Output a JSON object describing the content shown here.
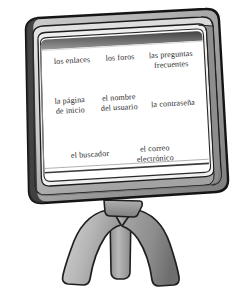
{
  "illustration": {
    "subject": "computer-monitor",
    "description_icons": {
      "monitor": "monitor-icon",
      "stand": "monitor-stand-icon",
      "screen": "screen-surface"
    },
    "colors": {
      "bezel_light": "#b9b9b9",
      "bezel_mid": "#9a9a9a",
      "bezel_dark": "#6f6f6f",
      "outline": "#1c1c1c",
      "screen": "#ffffff",
      "screen_shadow": "#3a3a3a",
      "text": "#2b2b2b",
      "stand_light": "#c3c3c3",
      "stand_dark": "#8a8a8a",
      "background": "#ffffff"
    }
  },
  "screen": {
    "rows": [
      {
        "row_name": "row-1",
        "items": [
          {
            "id": "item-los-enlaces",
            "label": "los enlaces"
          },
          {
            "id": "item-los-foros",
            "label": "los foros"
          },
          {
            "id": "item-las-preguntas",
            "label": "las preguntas\nfrecuentes"
          }
        ]
      },
      {
        "row_name": "row-2",
        "items": [
          {
            "id": "item-la-pagina",
            "label": "la página\nde inicio"
          },
          {
            "id": "item-el-nombre",
            "label": "el nombre\ndel usuario"
          },
          {
            "id": "item-la-contrasena",
            "label": "la contraseña"
          }
        ]
      },
      {
        "row_name": "row-3",
        "items": [
          {
            "id": "item-el-buscador",
            "label": "el buscador"
          },
          {
            "id": "item-el-correo",
            "label": "el correo\nelectrónico"
          }
        ]
      }
    ]
  }
}
